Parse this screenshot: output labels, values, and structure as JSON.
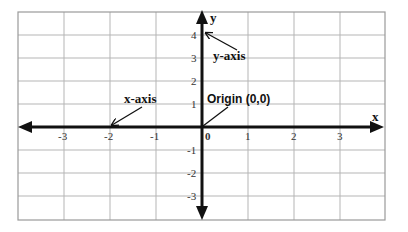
{
  "diagram": {
    "axes": {
      "x_label": "x",
      "y_label": "y",
      "x_ticks": [
        "-3",
        "-2",
        "-1",
        "0",
        "1",
        "2",
        "3"
      ],
      "y_ticks_positive": [
        "4",
        "3",
        "2",
        "1"
      ],
      "y_ticks_negative": [
        "-1",
        "-2",
        "-3"
      ]
    },
    "annotations": {
      "x_axis": "x-axis",
      "y_axis": "y-axis",
      "origin": "Origin (0,0)"
    },
    "colors": {
      "axis": "#111111",
      "grid": "#b5b5b5",
      "background": "#ffffff"
    }
  }
}
